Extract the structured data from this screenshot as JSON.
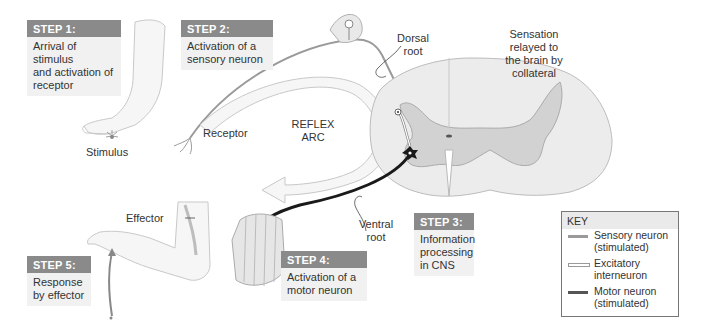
{
  "steps": [
    {
      "id": 1,
      "header": "STEP 1:",
      "text": [
        "Arrival of stimulus",
        "and activation of",
        "receptor"
      ]
    },
    {
      "id": 2,
      "header": "STEP 2:",
      "text": [
        "Activation of a",
        "sensory neuron"
      ]
    },
    {
      "id": 3,
      "header": "STEP 3:",
      "text": [
        "Information",
        "processing",
        "in CNS"
      ]
    },
    {
      "id": 4,
      "header": "STEP 4:",
      "text": [
        "Activation of a",
        "motor neuron"
      ]
    },
    {
      "id": 5,
      "header": "STEP 5:",
      "text": [
        "Response",
        "by effector"
      ]
    }
  ],
  "labels": {
    "stimulus": "Stimulus",
    "receptor": "Receptor",
    "reflex_arc": [
      "REFLEX",
      "ARC"
    ],
    "dorsal_root": [
      "Dorsal",
      "root"
    ],
    "ventral_root": [
      "Ventral",
      "root"
    ],
    "sensation": [
      "Sensation",
      "relayed to",
      "the brain by",
      "collateral"
    ],
    "effector": "Effector"
  },
  "key": {
    "title": "KEY",
    "items": [
      {
        "label": [
          "Sensory neuron",
          "(stimulated)"
        ],
        "style": "sensory",
        "color": "#9a9a9a"
      },
      {
        "label": [
          "Excitatory",
          "interneuron"
        ],
        "style": "interneuron",
        "color": "#ffffff"
      },
      {
        "label": [
          "Motor neuron",
          "(stimulated)"
        ],
        "style": "motor",
        "color": "#2a2a2a"
      }
    ]
  },
  "colors": {
    "step_header_bg": "#8a8a8a",
    "step_body_bg": "#f1f1f1",
    "spinal_white_matter": "#ececec",
    "spinal_gray_matter": "#cfcfcf",
    "motor_neuron": "#1a1a1a",
    "sensory_neuron": "#9a9a9a"
  }
}
